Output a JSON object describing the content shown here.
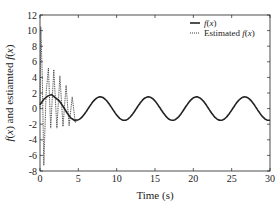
{
  "chart_data": {
    "type": "line",
    "title": "",
    "xlabel": "Time (s)",
    "ylabel": "f(x) and estiamted f(x)",
    "xlim": [
      0,
      30
    ],
    "ylim": [
      -8,
      12
    ],
    "xticks": [
      0,
      5,
      10,
      15,
      20,
      25,
      30
    ],
    "yticks": [
      -8,
      -6,
      -4,
      -2,
      0,
      2,
      4,
      6,
      8,
      10,
      12
    ],
    "grid": false,
    "legend_position": "upper right",
    "series": [
      {
        "name": "f(x)",
        "style": "solid",
        "description": "Approximately 1.5*sin(t) for t>5; transient near origin rising to ~1.8 around t=1.5, then settling to sinusoid with amplitude ~1.5 and period ~6.28"
      },
      {
        "name": "Estimated f(x)",
        "style": "dotted",
        "description": "Highly oscillatory transient in t in [0,5]: peak ~10.5 near t=0.1, minimum ~-7.3 near t=0.5, oscillations ~5 to -2.5 decaying to zero by t~5, then coincident with f(x)"
      }
    ],
    "sample_points": {
      "f(x)": [
        [
          0,
          0.5
        ],
        [
          0.5,
          1.2
        ],
        [
          1,
          1.6
        ],
        [
          1.5,
          1.8
        ],
        [
          2,
          1.4
        ],
        [
          2.5,
          1.0
        ],
        [
          3,
          0.3
        ],
        [
          3.5,
          -0.5
        ],
        [
          4,
          -1.2
        ],
        [
          4.5,
          -1.5
        ],
        [
          5,
          -1.44
        ],
        [
          6,
          -0.42
        ],
        [
          7,
          0.99
        ],
        [
          7.85,
          1.5
        ],
        [
          9,
          0.62
        ],
        [
          10,
          -0.82
        ],
        [
          11,
          -1.5
        ],
        [
          12,
          -0.8
        ],
        [
          14.1,
          1.5
        ],
        [
          17.3,
          -1.5
        ],
        [
          20.4,
          1.5
        ],
        [
          23.6,
          -1.5
        ],
        [
          26.7,
          1.5
        ],
        [
          29.8,
          -1.5
        ],
        [
          30,
          -1.48
        ]
      ],
      "Estimated f(x)": [
        [
          0,
          0
        ],
        [
          0.1,
          10.5
        ],
        [
          0.3,
          4
        ],
        [
          0.5,
          -7.3
        ],
        [
          0.8,
          2
        ],
        [
          1.1,
          5.2
        ],
        [
          1.4,
          -2.5
        ],
        [
          1.8,
          5
        ],
        [
          2.2,
          -2.5
        ],
        [
          2.6,
          4.2
        ],
        [
          3.0,
          -2.3
        ],
        [
          3.4,
          3
        ],
        [
          3.8,
          -2.2
        ],
        [
          4.2,
          1.5
        ],
        [
          4.6,
          -1.8
        ],
        [
          5,
          -1.44
        ]
      ]
    }
  }
}
